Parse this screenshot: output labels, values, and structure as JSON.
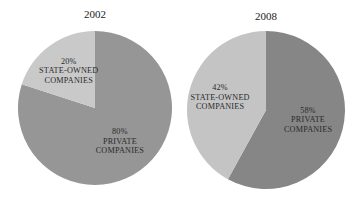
{
  "chart_data": [
    {
      "type": "pie",
      "title": "2002",
      "slices": [
        {
          "label": "PRIVATE COMPANIES",
          "value": 80,
          "display": "80%",
          "color": "#969696"
        },
        {
          "label": "STATE-OWNED COMPANIES",
          "value": 20,
          "display": "20%",
          "color": "#c9c9c9"
        }
      ]
    },
    {
      "type": "pie",
      "title": "2008",
      "slices": [
        {
          "label": "PRIVATE COMPANIES",
          "value": 58,
          "display": "58%",
          "color": "#868686"
        },
        {
          "label": "STATE-OWNED COMPANIES",
          "value": 42,
          "display": "42%",
          "color": "#c4c4c4"
        }
      ]
    }
  ]
}
